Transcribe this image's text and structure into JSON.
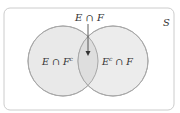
{
  "diagram": {
    "type": "venn",
    "universe_label": "S",
    "intersection_label": "E ∩ F",
    "left_region": {
      "base": "E ∩ F",
      "sup": "c"
    },
    "right_region": {
      "pre": "E",
      "sup": "c",
      "post": " ∩ F"
    },
    "colors": {
      "circle_fill": "#e8e8e8",
      "overlap_fill": "#dcdcdc",
      "stroke": "#aaaaaa",
      "frame": "#cccccc",
      "arrow": "#333333"
    }
  }
}
